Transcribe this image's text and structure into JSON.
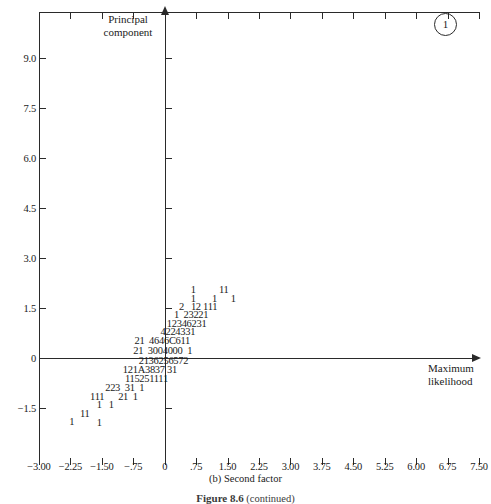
{
  "chart_data": {
    "type": "scatter",
    "title": "",
    "subtitle": "",
    "xlabel": "Maximum likelihood",
    "ylabel": "Principal component",
    "xlim": [
      -3.0,
      7.5
    ],
    "ylim": [
      -2.25,
      10.5
    ],
    "grid": false,
    "legend": null,
    "panel_label": "1",
    "caption": "(b) Second factor",
    "figure_caption_bold": "Figure 8.6",
    "figure_caption_rest": "(continued)",
    "xticks": [
      "-3.00",
      "-2.25",
      "-1.50",
      "-.75",
      "0",
      ".75",
      "1.50",
      "2.25",
      "3.00",
      "3.75",
      "4.50",
      "5.25",
      "6.00",
      "6.75",
      "7.50"
    ],
    "xtick_values": [
      -3.0,
      -2.25,
      -1.5,
      -0.75,
      0,
      0.75,
      1.5,
      2.25,
      3.0,
      3.75,
      4.5,
      5.25,
      6.0,
      6.75,
      7.5
    ],
    "yticks": [
      "9.0",
      "7.5",
      "6.0",
      "4.5",
      "3.0",
      "1.5",
      "0",
      "-1.5"
    ],
    "ytick_values": [
      9.0,
      7.5,
      6.0,
      4.5,
      3.0,
      1.5,
      0,
      -1.5
    ],
    "note": "Character-coded density scatter: each glyph gives the count of observations at that grid cell (digits 1-9, then A=10, B=11, C=12).",
    "rows": [
      {
        "y": 2.05,
        "x_start": 0.62,
        "text": "1          11"
      },
      {
        "y": 1.78,
        "x_start": 0.62,
        "text": "1       1      1"
      },
      {
        "y": 1.52,
        "x_start": 0.34,
        "text": "2   12 111"
      },
      {
        "y": 1.28,
        "x_start": 0.22,
        "text": "1  23221"
      },
      {
        "y": 1.03,
        "x_start": 0.05,
        "text": "12346231"
      },
      {
        "y": 0.78,
        "x_start": -0.1,
        "text": "4224331"
      },
      {
        "y": 0.5,
        "x_start": -0.72,
        "text": "21  4646C611"
      },
      {
        "y": 0.2,
        "x_start": -0.75,
        "text": "21  3004000  1"
      },
      {
        "y": -0.08,
        "x_start": -0.62,
        "text": "2136256572"
      },
      {
        "y": -0.36,
        "x_start": -1.0,
        "text": "121A3837 31"
      },
      {
        "y": -0.62,
        "x_start": -0.95,
        "text": "115251111"
      },
      {
        "y": -0.9,
        "x_start": -1.42,
        "text": "223  31  1"
      },
      {
        "y": -1.16,
        "x_start": -1.78,
        "text": "111      21  1"
      },
      {
        "y": -1.42,
        "x_start": -1.62,
        "text": "1   1"
      },
      {
        "y": -1.68,
        "x_start": -2.02,
        "text": "11"
      },
      {
        "y": -1.92,
        "x_start": -2.28,
        "text": "1"
      },
      {
        "y": -1.94,
        "x_start": -1.62,
        "text": "1"
      }
    ]
  },
  "axes": {
    "vertical_title": "Principal\ncomponent",
    "vertical_title_line1": "Principal",
    "vertical_title_line2": "component",
    "horizontal_title_line1": "Maximum",
    "horizontal_title_line2": "likelihood"
  }
}
